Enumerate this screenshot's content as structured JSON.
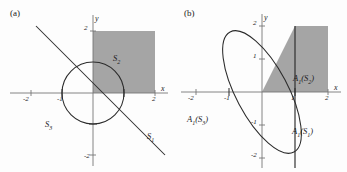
{
  "figure": {
    "background": "#fdfdfd",
    "ink": "#2b2b2b",
    "axis_color": "#6f6f6f",
    "shade_color": "#9d9d9d",
    "panels": [
      {
        "id": "a",
        "label": "(a)",
        "axes": {
          "x_name": "x",
          "y_name": "y",
          "x_ticks": [
            "-2",
            "-1",
            "1",
            "2"
          ],
          "y_ticks": [
            "2",
            "-1",
            "-2"
          ],
          "x_range": [
            -2.7,
            2.2
          ],
          "y_range": [
            -2.3,
            2.3
          ],
          "origin_px": [
            93,
            93
          ],
          "scale_px_per_unit": 31
        },
        "shapes": [
          {
            "name": "shaded-square",
            "kind": "rect",
            "label": "S2",
            "x0": 0,
            "y0": 0,
            "x1": 2,
            "y1": 2,
            "filled": true
          },
          {
            "name": "circle",
            "kind": "circle",
            "label": "S3",
            "cx": 0,
            "cy": 0,
            "r": 1,
            "filled": false
          },
          {
            "name": "line",
            "kind": "line",
            "label": "S1",
            "slope": -1.0,
            "intercept": 1.73
          }
        ],
        "annotations": [
          {
            "name": "label-S2",
            "text": "S",
            "sub": "2",
            "x": 113,
            "y": 55
          },
          {
            "name": "label-S3",
            "text": "S",
            "sub": "3",
            "x": 45,
            "y": 121
          },
          {
            "name": "label-S1",
            "text": "S",
            "sub": "1",
            "x": 147,
            "y": 133
          }
        ]
      },
      {
        "id": "b",
        "label": "(b)",
        "axes": {
          "x_name": "x",
          "y_name": "y",
          "x_ticks": [
            "-2",
            "-1",
            "1",
            "2"
          ],
          "y_ticks": [
            "2",
            "1",
            "-1",
            "-2"
          ],
          "x_range": [
            -2.7,
            2.2
          ],
          "y_range": [
            -2.3,
            2.3
          ],
          "origin_px": [
            89,
            92
          ],
          "scale_px_per_unit": 33
        },
        "shapes": [
          {
            "name": "shaded-image-of-square",
            "kind": "polygon",
            "label": "A1(S2)",
            "points": [
              [
                0,
                0
              ],
              [
                1,
                2
              ],
              [
                2,
                2
              ],
              [
                2,
                0
              ]
            ],
            "filled": true
          },
          {
            "name": "sheared-ellipse",
            "kind": "ellipse",
            "label": "A1(S3)",
            "shear": 0.5,
            "r": 1,
            "filled": false
          },
          {
            "name": "vertical-line",
            "kind": "line",
            "label": "A1(S1)",
            "x_const": 1.0
          }
        ],
        "annotations": [
          {
            "name": "label-A1S2",
            "text": "A",
            "sub": "1",
            "arg": "(S",
            "argsub": "2",
            "argend": ")",
            "x": 120,
            "y": 75
          },
          {
            "name": "label-A1S3",
            "text": "A",
            "sub": "1",
            "arg": "(S",
            "argsub": "3",
            "argend": ")",
            "x": 14,
            "y": 117
          },
          {
            "name": "label-A1S1",
            "text": "A",
            "sub": "1",
            "arg": "(S",
            "argsub": "1",
            "argend": ")",
            "x": 118,
            "y": 129
          }
        ]
      }
    ]
  }
}
